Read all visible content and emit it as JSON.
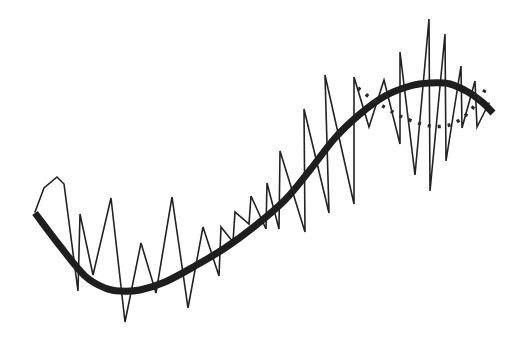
{
  "chart_data": {
    "type": "line",
    "title": "",
    "xlabel": "",
    "ylabel": "",
    "grid": false,
    "legend": null,
    "axes_visible": false,
    "coordinate_space": "pixel (origin top-left, y increases downward)",
    "series": [
      {
        "name": "noisy-signal",
        "style": "thin-solid",
        "color": "#222222",
        "points": [
          [
            35,
            212
          ],
          [
            44,
            188
          ],
          [
            57,
            177
          ],
          [
            64,
            184
          ],
          [
            78,
            291
          ],
          [
            80,
            214
          ],
          [
            93,
            275
          ],
          [
            111,
            198
          ],
          [
            125,
            322
          ],
          [
            141,
            243
          ],
          [
            156,
            293
          ],
          [
            172,
            197
          ],
          [
            188,
            308
          ],
          [
            203,
            227
          ],
          [
            219,
            276
          ],
          [
            221,
            227
          ],
          [
            233,
            242
          ],
          [
            235,
            212
          ],
          [
            249,
            224
          ],
          [
            251,
            196
          ],
          [
            266,
            229
          ],
          [
            267,
            183
          ],
          [
            279,
            229
          ],
          [
            280,
            151
          ],
          [
            305,
            232
          ],
          [
            304,
            109
          ],
          [
            329,
            213
          ],
          [
            325,
            75
          ],
          [
            354,
            204
          ],
          [
            354,
            77
          ],
          [
            369,
            127
          ],
          [
            384,
            80
          ],
          [
            400,
            144
          ],
          [
            400,
            52
          ],
          [
            415,
            175
          ],
          [
            429,
            19
          ],
          [
            430,
            191
          ],
          [
            445,
            34
          ],
          [
            446,
            161
          ],
          [
            461,
            66
          ],
          [
            462,
            128
          ],
          [
            475,
            81
          ],
          [
            477,
            127
          ],
          [
            489,
            103
          ]
        ]
      },
      {
        "name": "smooth-trend",
        "style": "thick-solid",
        "color": "#1e1e1e",
        "points": [
          [
            35,
            213
          ],
          [
            60,
            246
          ],
          [
            85,
            276
          ],
          [
            105,
            288
          ],
          [
            120,
            291
          ],
          [
            140,
            290
          ],
          [
            165,
            282
          ],
          [
            195,
            266
          ],
          [
            225,
            248
          ],
          [
            255,
            226
          ],
          [
            285,
            200
          ],
          [
            310,
            170
          ],
          [
            335,
            138
          ],
          [
            360,
            114
          ],
          [
            385,
            96
          ],
          [
            410,
            86
          ],
          [
            430,
            83
          ],
          [
            450,
            84
          ],
          [
            468,
            92
          ],
          [
            482,
            102
          ],
          [
            493,
            113
          ]
        ]
      },
      {
        "name": "dotted-fit",
        "style": "dotted",
        "color": "#2a2a2a",
        "points": [
          [
            358,
            88
          ],
          [
            372,
            99
          ],
          [
            386,
            108
          ],
          [
            400,
            116
          ],
          [
            415,
            122
          ],
          [
            430,
            126
          ],
          [
            445,
            126
          ],
          [
            458,
            121
          ],
          [
            470,
            111
          ],
          [
            480,
            98
          ],
          [
            488,
            85
          ]
        ]
      }
    ]
  }
}
